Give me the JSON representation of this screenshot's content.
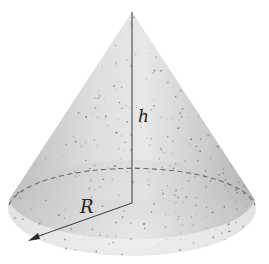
{
  "figure": {
    "type": "cone",
    "labels": {
      "height": "h",
      "radius": "R"
    },
    "colors": {
      "background": "#ffffff",
      "surface_light": "#ececec",
      "surface_mid": "#cfcfcf",
      "surface_dark": "#a9a9a9",
      "line": "#3a3a3a",
      "dashed": "#6a6a6a",
      "speckle": "#6e6e6e"
    },
    "geometry": {
      "apex": [
        132,
        12
      ],
      "base_center": [
        132,
        208
      ],
      "base_rx": 124,
      "base_ry": 45,
      "radius_end": [
        30,
        240
      ]
    }
  }
}
